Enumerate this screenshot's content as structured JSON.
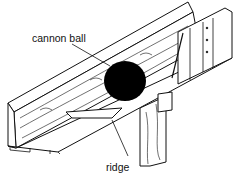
{
  "diagram": {
    "labels": {
      "cannon_ball": "cannon ball",
      "ridge": "ridge"
    },
    "colors": {
      "ink": "#111111",
      "ball": "#000000",
      "background": "#ffffff"
    }
  }
}
